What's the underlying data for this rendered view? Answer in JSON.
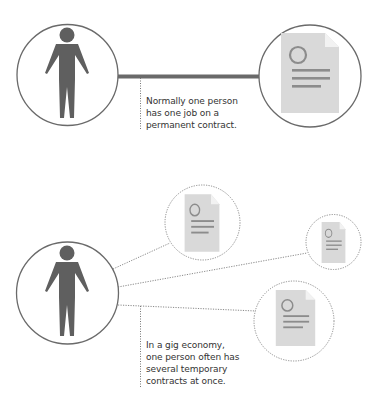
{
  "colors": {
    "figure": "#5f5f5f",
    "circle_stroke": "#6a6a6a",
    "dashed_stroke": "#8a8a8a",
    "bar": "#6a6a6a",
    "document_fill": "#d9d9d9",
    "document_lines": "#8c8c8c",
    "text": "#333333"
  },
  "permanent_panel": {
    "person_icon": "person-icon",
    "contract_icon": "document-icon",
    "connector": "solid-thick-line",
    "caption": {
      "lines": [
        "Normally one person",
        "has one job on a",
        "permanent contract."
      ]
    }
  },
  "gig_panel": {
    "person_icon": "person-icon",
    "contract_icons": [
      "document-icon",
      "document-icon",
      "document-icon"
    ],
    "connector": "dotted-lines",
    "caption": {
      "lines": [
        "In a gig economy,",
        "one person often has",
        "several temporary",
        "contracts at once."
      ]
    }
  }
}
